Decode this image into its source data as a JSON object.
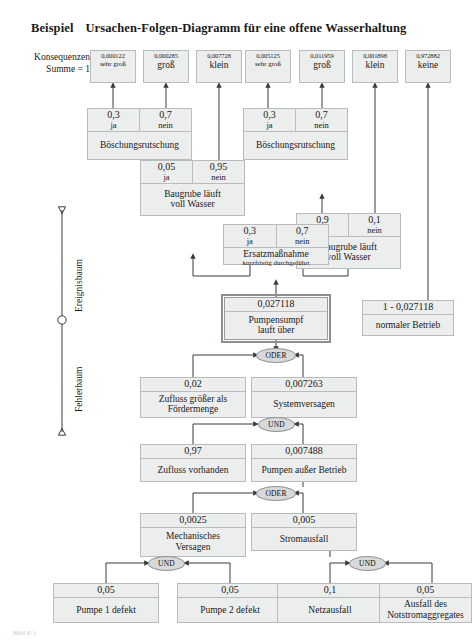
{
  "title": {
    "keyword": "Beispiel",
    "text": "Ursachen-Folgen-Diagramm für eine offene Wasserhaltung"
  },
  "axis": {
    "upper_label": "Ereignisbaum",
    "lower_label": "Fehlerbaum"
  },
  "consequence_header": {
    "line1": "Konsequenzen",
    "line2": "Summe = 1"
  },
  "consequences": [
    {
      "probability": "0,000122",
      "name": "sehr groß",
      "small": true
    },
    {
      "probability": "0,000285",
      "name": "groß",
      "small": false
    },
    {
      "probability": "0,007728",
      "name": "klein",
      "small": false
    },
    {
      "probability": "0,005125",
      "name": "sehr groß",
      "small": true
    },
    {
      "probability": "0,011959",
      "name": "groß",
      "small": false
    },
    {
      "probability": "0,001898",
      "name": "klein",
      "small": false
    },
    {
      "probability": "0,972882",
      "name": "keine",
      "small": false
    }
  ],
  "event_nodes": {
    "boeschung_left": {
      "label": "Böschungsrutschung",
      "branches": [
        {
          "value": "0,3",
          "outcome": "ja"
        },
        {
          "value": "0,7",
          "outcome": "nein"
        }
      ]
    },
    "boeschung_right": {
      "label": "Böschungsrutschung",
      "branches": [
        {
          "value": "0,3",
          "outcome": "ja"
        },
        {
          "value": "0,7",
          "outcome": "nein"
        }
      ]
    },
    "baugrube_left": {
      "label": "Baugrube läuft voll Wasser",
      "label_line1": "Baugrube läuft",
      "label_line2": "voll Wasser",
      "branches": [
        {
          "value": "0,05",
          "outcome": "ja"
        },
        {
          "value": "0,95",
          "outcome": "nein"
        }
      ]
    },
    "baugrube_right": {
      "label": "Baugrube läuft voll Wasser",
      "label_line1": "Baugrube läuft",
      "label_line2": "voll Wasser",
      "branches": [
        {
          "value": "0,9",
          "outcome": "ja"
        },
        {
          "value": "0,1",
          "outcome": "nein"
        }
      ]
    },
    "ersatzmassnahme": {
      "label": "Ersatzmaßnahme",
      "sublabel": "kurzfristig durchgeführt",
      "branches": [
        {
          "value": "0,3",
          "outcome": "ja"
        },
        {
          "value": "0,7",
          "outcome": "nein"
        }
      ]
    }
  },
  "fault_nodes": {
    "pumpensumpf": {
      "value": "0,027118",
      "label_line1": "Pumpensumpf",
      "label_line2": "lauft über",
      "highlighted": true
    },
    "normalbetrieb": {
      "value": "1 - 0,027118",
      "label": "normaler Betrieb"
    },
    "zufluss_groesser": {
      "value": "0,02",
      "label_line1": "Zufluss größer als",
      "label_line2": "Fördermenge"
    },
    "systemversagen": {
      "value": "0,007263",
      "label": "Systemversagen"
    },
    "zufluss_vorhanden": {
      "value": "0,97",
      "label": "Zufluss vorhanden"
    },
    "pumpen_ausser_betrieb": {
      "value": "0,007488",
      "label": "Pumpen außer Betrieb"
    },
    "mechanisches_versagen": {
      "value": "0,0025",
      "label_line1": "Mechanisches",
      "label_line2": "Versagen"
    },
    "stromausfall": {
      "value": "0,005",
      "label": "Stromausfall"
    },
    "pumpe1": {
      "value": "0,05",
      "label": "Pumpe 1 defekt"
    },
    "pumpe2": {
      "value": "0,05",
      "label": "Pumpe 2 defekt"
    },
    "netzausfall": {
      "value": "0,1",
      "label": "Netzausfall"
    },
    "notstrom": {
      "value": "0,05",
      "label_line1": "Ausfall des",
      "label_line2": "Notstromaggregates"
    }
  },
  "gates": [
    {
      "id": "gate-oder-top",
      "label": "ODER"
    },
    {
      "id": "gate-und-mid",
      "label": "UND"
    },
    {
      "id": "gate-oder-mid",
      "label": "ODER"
    },
    {
      "id": "gate-und-left",
      "label": "UND"
    },
    {
      "id": "gate-und-right",
      "label": "UND"
    }
  ],
  "colors": {
    "node_fill": "#eceded",
    "node_border": "#b9bcbd",
    "gate_fill": "#d8d9da",
    "line": "#3a3a3a",
    "text": "#1a1a1a"
  },
  "footer": {
    "caption": "Bild 8-1"
  }
}
